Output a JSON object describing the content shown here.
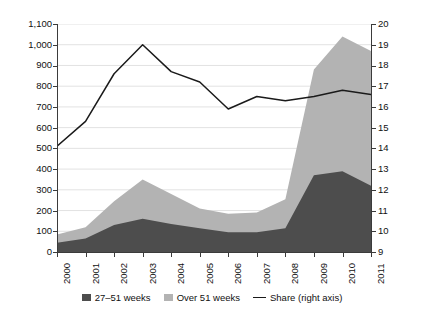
{
  "chart_data": {
    "type": "area",
    "title": "",
    "xlabel": "",
    "ylabel": "",
    "categories": [
      "2000",
      "2001",
      "2002",
      "2003",
      "2004",
      "2005",
      "2006",
      "2007",
      "2008",
      "2009",
      "2010",
      "2011"
    ],
    "series": [
      {
        "name": "27–51 weeks",
        "axis": "left",
        "type": "stacked-area",
        "color": "#4d4d4d",
        "values": [
          45,
          65,
          130,
          160,
          135,
          115,
          95,
          95,
          115,
          370,
          390,
          320
        ]
      },
      {
        "name": "Over 51 weeks",
        "axis": "left",
        "type": "stacked-area",
        "color": "#b3b3b3",
        "values": [
          40,
          55,
          115,
          190,
          145,
          95,
          90,
          95,
          140,
          510,
          650,
          650
        ]
      },
      {
        "name": "Share (right axis)",
        "axis": "right",
        "type": "line",
        "color": "#1a1a1a",
        "values": [
          14.1,
          15.3,
          17.6,
          19.0,
          17.7,
          17.2,
          15.9,
          16.5,
          16.3,
          16.5,
          16.8,
          16.6
        ]
      }
    ],
    "stacked_totals": [
      85,
      120,
      245,
      350,
      280,
      210,
      185,
      190,
      255,
      880,
      1040,
      970
    ],
    "left_axis": {
      "min": 0,
      "max": 1100,
      "step": 100,
      "ticks": [
        "0",
        "100",
        "200",
        "300",
        "400",
        "500",
        "600",
        "700",
        "800",
        "900",
        "1,000",
        "1,100"
      ]
    },
    "right_axis": {
      "min": 9,
      "max": 20,
      "step": 1,
      "ticks": [
        "9",
        "10",
        "11",
        "12",
        "13",
        "14",
        "15",
        "16",
        "17",
        "18",
        "19",
        "20"
      ]
    },
    "grid": true,
    "legend_position": "bottom"
  },
  "legend": {
    "items": [
      {
        "label": "27–51 weeks",
        "marker": "square-dark",
        "color": "#4d4d4d"
      },
      {
        "label": "Over 51 weeks",
        "marker": "square-light",
        "color": "#b3b3b3"
      },
      {
        "label": "Share (right axis)",
        "marker": "line",
        "color": "#1a1a1a"
      }
    ]
  },
  "colors": {
    "dark_area": "#4d4d4d",
    "light_area": "#b3b3b3",
    "line": "#1a1a1a",
    "axis": "#3b3b3b",
    "grid": "#e2e2e2",
    "background": "#ffffff"
  }
}
